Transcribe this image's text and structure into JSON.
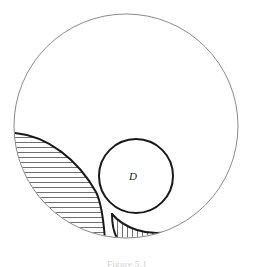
{
  "figure": {
    "caption": "Figure 5.1",
    "background_color": "#ffffff",
    "labels": {
      "inner_circle": "D"
    },
    "colors": {
      "outer_stroke": "#8a8a8a",
      "heavy_stroke": "#1a1a1a",
      "hatch_stroke": "#4a4a4a",
      "label_color": "#1a1a1a",
      "caption_color": "#cfcfcf"
    },
    "shapes": {
      "outer_circle": {
        "name": "outer-circle",
        "center_x": 126,
        "center_y": 126,
        "radius": 112,
        "stroke_width": 1,
        "fill": "none"
      },
      "inner_circle_D": {
        "name": "inner-circle-D",
        "center_x": 136,
        "center_y": 176,
        "radius": 37,
        "stroke_width": 2,
        "fill": "none",
        "label": "D",
        "label_x": 133,
        "label_y": 180
      },
      "left_lune": {
        "name": "left-lune-region",
        "hatch_direction": "horizontal",
        "hatch_spacing_px": 5,
        "stroke_width": 2
      },
      "bottom_lune": {
        "name": "bottom-lune-region",
        "hatch_direction": "vertical",
        "hatch_spacing_px": 5,
        "stroke_width": 2
      }
    }
  }
}
